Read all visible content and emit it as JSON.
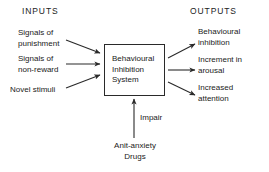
{
  "diagram": {
    "headers": {
      "inputs": "INPUTS",
      "outputs": "OUTPUTS"
    },
    "central_node": {
      "label": "Behavioural\nInhibition\nSystem"
    },
    "inputs": [
      {
        "label": "Signals of\npunishment"
      },
      {
        "label": "Signals of\nnon-reward"
      },
      {
        "label": "Novel stimuli"
      }
    ],
    "outputs": [
      {
        "label": "Behavioural\ninhibition"
      },
      {
        "label": "Increment in\narousal"
      },
      {
        "label": "Increased\nattention"
      }
    ],
    "modulator": {
      "edge_label": "Impair",
      "source_label": "Anit-anxiety\nDrugs"
    },
    "colors": {
      "background": "#ffffff",
      "stroke": "#2a2a2a",
      "text": "#1a1a1a"
    }
  }
}
